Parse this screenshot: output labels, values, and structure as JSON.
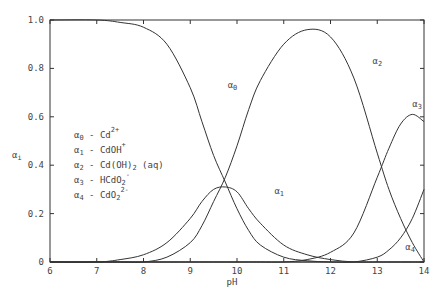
{
  "chart_data": {
    "type": "line",
    "title": "",
    "xlabel": "pH",
    "ylabel": "α_i",
    "xlim": [
      6,
      14
    ],
    "ylim": [
      0,
      1.0
    ],
    "x_ticks": [
      "6",
      "7",
      "8",
      "9",
      "10",
      "11",
      "12",
      "13",
      "14"
    ],
    "y_ticks": [
      "0",
      "0.2",
      "0.4",
      "0.6",
      "0.8",
      "1.0"
    ],
    "grid": false,
    "legend": [
      {
        "symbol": "α0",
        "species": "Cd2+"
      },
      {
        "symbol": "α1",
        "species": "CdOH+"
      },
      {
        "symbol": "α2",
        "species": "Cd(OH)2 (aq)"
      },
      {
        "symbol": "α3",
        "species": "HCdO2-"
      },
      {
        "symbol": "α4",
        "species": "CdO2 2-"
      }
    ],
    "x": [
      6.0,
      7.0,
      7.5,
      8.0,
      8.5,
      9.0,
      9.25,
      9.5,
      9.75,
      10.0,
      10.25,
      10.5,
      11.0,
      11.5,
      12.0,
      12.5,
      13.0,
      13.25,
      13.5,
      13.75,
      14.0
    ],
    "series": [
      {
        "name": "α0",
        "values": [
          1.0,
          1.0,
          0.99,
          0.97,
          0.9,
          0.72,
          0.58,
          0.44,
          0.33,
          0.22,
          0.13,
          0.07,
          0.02,
          0.005,
          0.0,
          0.0,
          0.0,
          0.0,
          0.0,
          0.0,
          0.0
        ]
      },
      {
        "name": "α1",
        "values": [
          0.0,
          0.0,
          0.01,
          0.03,
          0.08,
          0.18,
          0.25,
          0.3,
          0.31,
          0.29,
          0.22,
          0.16,
          0.07,
          0.03,
          0.01,
          0.0,
          0.0,
          0.0,
          0.0,
          0.0,
          0.0
        ]
      },
      {
        "name": "α2",
        "values": [
          0.0,
          0.0,
          0.0,
          0.0,
          0.02,
          0.08,
          0.15,
          0.25,
          0.35,
          0.48,
          0.63,
          0.75,
          0.9,
          0.96,
          0.93,
          0.76,
          0.45,
          0.3,
          0.18,
          0.08,
          0.0
        ]
      },
      {
        "name": "α3",
        "values": [
          0.0,
          0.0,
          0.0,
          0.0,
          0.0,
          0.0,
          0.0,
          0.0,
          0.0,
          0.0,
          0.0,
          0.0,
          0.0,
          0.01,
          0.04,
          0.12,
          0.35,
          0.47,
          0.57,
          0.61,
          0.58
        ]
      },
      {
        "name": "α4",
        "values": [
          0.0,
          0.0,
          0.0,
          0.0,
          0.0,
          0.0,
          0.0,
          0.0,
          0.0,
          0.0,
          0.0,
          0.0,
          0.0,
          0.0,
          0.0,
          0.0,
          0.02,
          0.05,
          0.1,
          0.18,
          0.3
        ]
      }
    ],
    "annotations": [
      {
        "text": "α0",
        "x": 9.8,
        "y": 0.72
      },
      {
        "text": "α1",
        "x": 10.8,
        "y": 0.28
      },
      {
        "text": "α2",
        "x": 12.9,
        "y": 0.82
      },
      {
        "text": "α3",
        "x": 13.75,
        "y": 0.64
      },
      {
        "text": "α4",
        "x": 13.6,
        "y": 0.05
      }
    ]
  },
  "labels": {
    "xlabel": "pH",
    "ylabel_main": "α",
    "ylabel_sub": "i",
    "legend": [
      {
        "sym": "α",
        "sub": "0",
        "eq": " - Cd",
        "sup": "2+",
        "rest": ""
      },
      {
        "sym": "α",
        "sub": "1",
        "eq": " - CdOH",
        "sup": "+",
        "rest": ""
      },
      {
        "sym": "α",
        "sub": "2",
        "eq": " - Cd(OH)",
        "sub2": "2",
        "rest": " (aq)"
      },
      {
        "sym": "α",
        "sub": "3",
        "eq": " - HCdO",
        "sub2": "2",
        "sup": "-"
      },
      {
        "sym": "α",
        "sub": "4",
        "eq": " - CdO",
        "sub2": "2",
        "sup": "2-"
      }
    ]
  }
}
